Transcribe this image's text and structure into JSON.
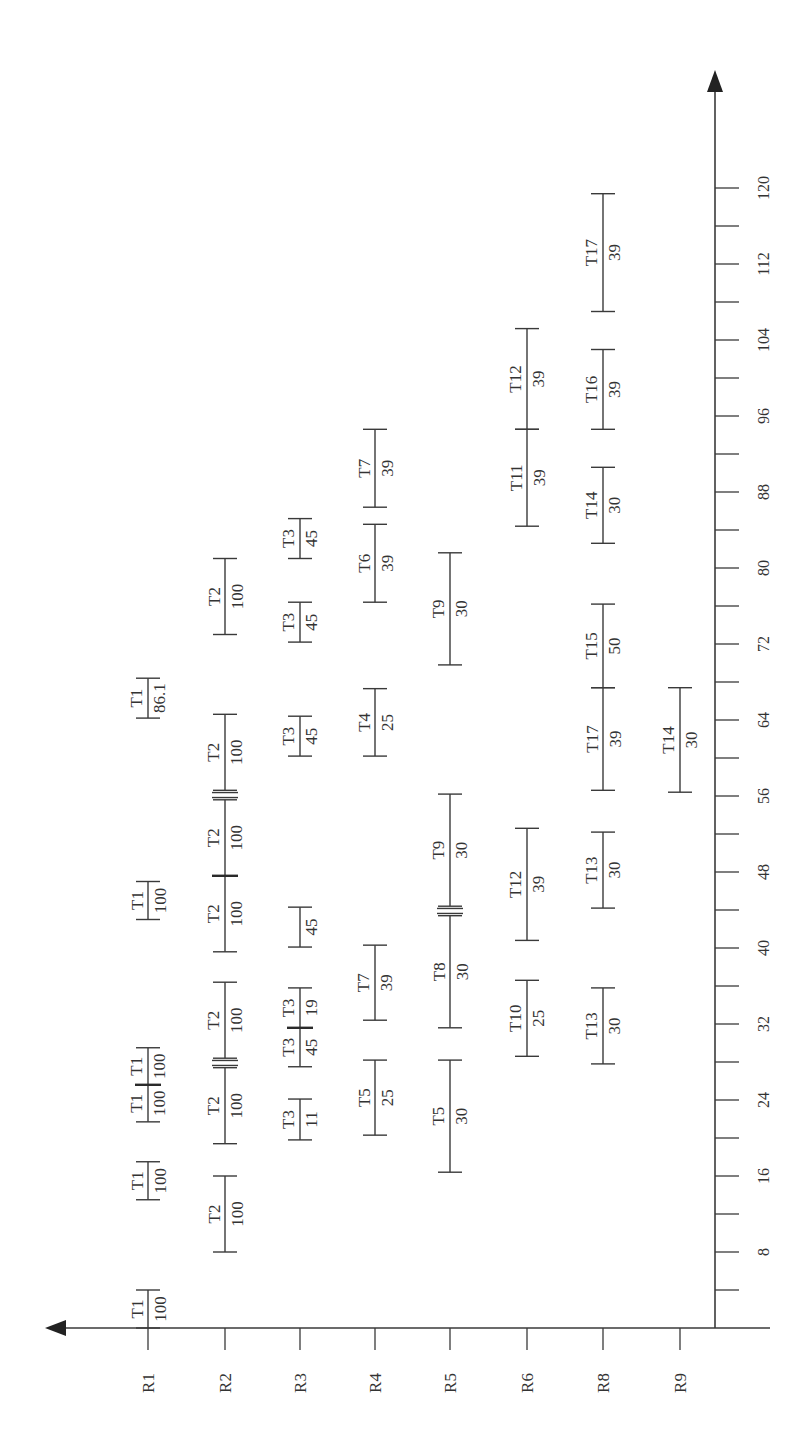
{
  "diagram": {
    "title": "",
    "time_axis": {
      "label": "",
      "ticks": [
        8,
        16,
        24,
        32,
        40,
        48,
        56,
        64,
        72,
        80,
        88,
        96,
        104,
        112,
        120
      ],
      "minor_step": 4,
      "max": 124
    },
    "resources": [
      "R1",
      "R2",
      "R3",
      "R4",
      "R5",
      "R6",
      "R8",
      "R9"
    ],
    "tasks": [
      {
        "resource": "R1",
        "task": "T1",
        "value": "100",
        "start": 0,
        "end": 4
      },
      {
        "resource": "R1",
        "task": "T1",
        "value": "100",
        "start": 13.5,
        "end": 17.5
      },
      {
        "resource": "R1",
        "task": "T1",
        "value": "100",
        "start": 21.7,
        "end": 25.6
      },
      {
        "resource": "R1",
        "task": "T1",
        "value": "100",
        "start": 25.6,
        "end": 29.5
      },
      {
        "resource": "R1",
        "task": "T1",
        "value": "100",
        "start": 43,
        "end": 47
      },
      {
        "resource": "R1",
        "task": "T1",
        "value": "86.1",
        "start": 64.2,
        "end": 68.4
      },
      {
        "resource": "R2",
        "task": "T2",
        "value": "100",
        "start": 8,
        "end": 16
      },
      {
        "resource": "R2",
        "task": "T2",
        "value": "100",
        "start": 19.4,
        "end": 27.4
      },
      {
        "resource": "R2",
        "task": "T2",
        "value": "100",
        "start": 28.4,
        "end": 36.4
      },
      {
        "resource": "R2",
        "task": "T2",
        "value": "100",
        "start": 39.6,
        "end": 47.6
      },
      {
        "resource": "R2",
        "task": "T2",
        "value": "100",
        "start": 47.6,
        "end": 55.6
      },
      {
        "resource": "R2",
        "task": "T2",
        "value": "100",
        "start": 56.6,
        "end": 64.6
      },
      {
        "resource": "R2",
        "task": "T2",
        "value": "100",
        "start": 73,
        "end": 81
      },
      {
        "resource": "R3",
        "task": "T3",
        "value": "11",
        "start": 19.8,
        "end": 24.1
      },
      {
        "resource": "R3",
        "task": "T3",
        "value": "45",
        "start": 27.5,
        "end": 31.6
      },
      {
        "resource": "R3",
        "task": "T3",
        "value": "19",
        "start": 31.6,
        "end": 35.8
      },
      {
        "resource": "R3",
        "task": "",
        "value": "45",
        "start": 40.1,
        "end": 44.3
      },
      {
        "resource": "R3",
        "task": "T3",
        "value": "45",
        "start": 60.2,
        "end": 64.4
      },
      {
        "resource": "R3",
        "task": "T3",
        "value": "45",
        "start": 72.2,
        "end": 76.4
      },
      {
        "resource": "R3",
        "task": "T3",
        "value": "45",
        "start": 81,
        "end": 85.2
      },
      {
        "resource": "R4",
        "task": "T5",
        "value": "25",
        "start": 20.3,
        "end": 28.2
      },
      {
        "resource": "R4",
        "task": "T7",
        "value": "39",
        "start": 32.4,
        "end": 40.3
      },
      {
        "resource": "R4",
        "task": "T4",
        "value": "25",
        "start": 60.2,
        "end": 67.3
      },
      {
        "resource": "R4",
        "task": "T6",
        "value": "39",
        "start": 76.4,
        "end": 84.6
      },
      {
        "resource": "R4",
        "task": "T7",
        "value": "39",
        "start": 86.4,
        "end": 94.6
      },
      {
        "resource": "R5",
        "task": "T5",
        "value": "30",
        "start": 16.4,
        "end": 28.2
      },
      {
        "resource": "R5",
        "task": "T8",
        "value": "30",
        "start": 31.6,
        "end": 43.4
      },
      {
        "resource": "R5",
        "task": "T9",
        "value": "30",
        "start": 44.4,
        "end": 56.2
      },
      {
        "resource": "R5",
        "task": "T9",
        "value": "30",
        "start": 69.8,
        "end": 81.6
      },
      {
        "resource": "R6",
        "task": "T10",
        "value": "25",
        "start": 28.6,
        "end": 36.6
      },
      {
        "resource": "R6",
        "task": "T12",
        "value": "39",
        "start": 40.8,
        "end": 52.6
      },
      {
        "resource": "R6",
        "task": "T11",
        "value": "39",
        "start": 84.4,
        "end": 94.6
      },
      {
        "resource": "R6",
        "task": "T12",
        "value": "39",
        "start": 94.6,
        "end": 105.2
      },
      {
        "resource": "R8",
        "task": "T13",
        "value": "30",
        "start": 27.8,
        "end": 35.8
      },
      {
        "resource": "R8",
        "task": "T13",
        "value": "30",
        "start": 44.2,
        "end": 52.2
      },
      {
        "resource": "R8",
        "task": "T17",
        "value": "39",
        "start": 56.6,
        "end": 67.4
      },
      {
        "resource": "R8",
        "task": "T15",
        "value": "50",
        "start": 67.4,
        "end": 76.2
      },
      {
        "resource": "R8",
        "task": "T14",
        "value": "30",
        "start": 82.6,
        "end": 90.6
      },
      {
        "resource": "R8",
        "task": "T16",
        "value": "39",
        "start": 94.6,
        "end": 103
      },
      {
        "resource": "R8",
        "task": "T17",
        "value": "39",
        "start": 107,
        "end": 119.4
      },
      {
        "resource": "R9",
        "task": "T14",
        "value": "30",
        "start": 56.4,
        "end": 67.4
      }
    ],
    "split_markers": [
      {
        "resource": "R1",
        "at": 25.6,
        "style": "thick"
      },
      {
        "resource": "R2",
        "at": 47.6,
        "style": "thick"
      },
      {
        "resource": "R3",
        "at": 31.6,
        "style": "thick"
      }
    ],
    "double_markers": [
      {
        "resource": "R2",
        "at": 27.9
      },
      {
        "resource": "R2",
        "at": 56.1
      },
      {
        "resource": "R5",
        "at": 43.9
      }
    ]
  }
}
